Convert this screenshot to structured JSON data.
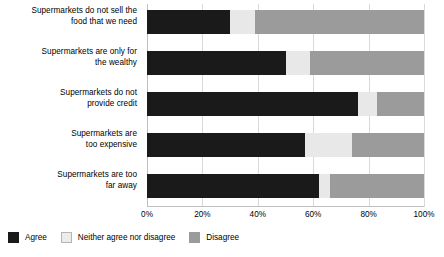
{
  "chart_data": {
    "type": "bar",
    "subtype": "stacked-horizontal-100pct",
    "title": "",
    "xlabel": "",
    "ylabel": "",
    "xlim": [
      0,
      100
    ],
    "xticks": [
      "0%",
      "20%",
      "40%",
      "60%",
      "80%",
      "100%"
    ],
    "xtick_values": [
      0,
      20,
      40,
      60,
      80,
      100
    ],
    "grid": true,
    "grid_axis": "x",
    "legend_position": "bottom-left",
    "categories": [
      "Supermarkets do not sell the food that we need",
      "Supermarkets are only for the wealthy",
      "Supermarkets do not provide credit",
      "Supermarkets are too expensive",
      "Supermarkets are too far away"
    ],
    "series": [
      {
        "name": "Agree",
        "color": "#1a1a1a",
        "values": [
          30,
          50,
          76,
          57,
          62
        ]
      },
      {
        "name": "Neither agree nor disagree",
        "color": "#e8e8e8",
        "values": [
          9,
          9,
          7,
          17,
          4
        ]
      },
      {
        "name": "Disagree",
        "color": "#9b9b9b",
        "values": [
          61,
          41,
          17,
          26,
          34
        ]
      }
    ]
  },
  "categories_display": [
    {
      "line1": "Supermarkets do not sell the",
      "line2": "food that we need"
    },
    {
      "line1": "Supermarkets are only for",
      "line2": "the wealthy"
    },
    {
      "line1": "Supermarkets do not",
      "line2": "provide credit"
    },
    {
      "line1": "Supermarkets are",
      "line2": "too expensive"
    },
    {
      "line1": "Supermarkets are too",
      "line2": "far away"
    }
  ],
  "legend": {
    "items": [
      {
        "label": "Agree",
        "color": "#1a1a1a"
      },
      {
        "label": "Neither agree nor disagree",
        "color": "#e8e8e8"
      },
      {
        "label": "Disagree",
        "color": "#9b9b9b"
      }
    ]
  }
}
